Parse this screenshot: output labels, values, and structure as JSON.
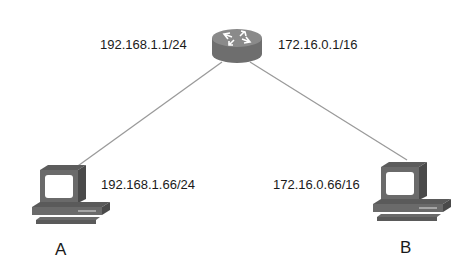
{
  "diagram": {
    "type": "network-topology",
    "router": {
      "name": "router",
      "left_interface": "192.168.1.1/24",
      "right_interface": "172.16.0.1/16"
    },
    "hosts": [
      {
        "label": "A",
        "address": "192.168.1.66/24"
      },
      {
        "label": "B",
        "address": "172.16.0.66/16"
      }
    ],
    "links": [
      {
        "from": "router",
        "to": "A"
      },
      {
        "from": "router",
        "to": "B"
      }
    ]
  }
}
